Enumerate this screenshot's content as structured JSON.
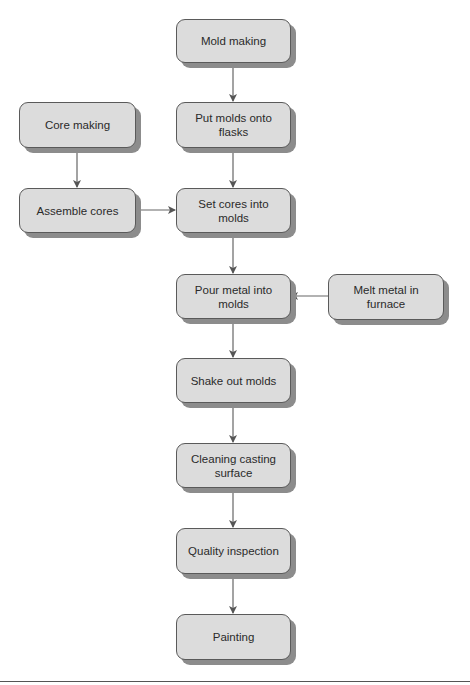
{
  "diagram": {
    "type": "flowchart",
    "nodes": {
      "mold_making": "Mold making",
      "put_molds": "Put molds onto flasks",
      "core_making": "Core making",
      "assemble_cores": "Assemble cores",
      "set_cores": "Set cores into molds",
      "pour_metal": "Pour metal into molds",
      "melt_metal": "Melt metal in furnace",
      "shake_out": "Shake out molds",
      "cleaning": "Cleaning casting surface",
      "quality": "Quality inspection",
      "painting": "Painting"
    },
    "edges": [
      [
        "mold_making",
        "put_molds"
      ],
      [
        "put_molds",
        "set_cores"
      ],
      [
        "core_making",
        "assemble_cores"
      ],
      [
        "assemble_cores",
        "set_cores"
      ],
      [
        "set_cores",
        "pour_metal"
      ],
      [
        "melt_metal",
        "pour_metal"
      ],
      [
        "pour_metal",
        "shake_out"
      ],
      [
        "shake_out",
        "cleaning"
      ],
      [
        "cleaning",
        "quality"
      ],
      [
        "quality",
        "painting"
      ]
    ]
  },
  "colors": {
    "node_fill": "#dcdcdc",
    "node_border": "#5a5a5a",
    "node_shadow": "#8c8c8c",
    "edge": "#555555"
  }
}
